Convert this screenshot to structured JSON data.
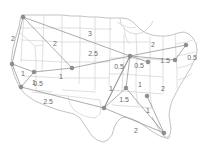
{
  "figure": {
    "title": "",
    "kind": "map-network-diagram",
    "basemap": "united-states-state-boundaries",
    "width": 202,
    "height": 151,
    "colors": {
      "background": "#ffffff",
      "state_border": "#c8c8c8",
      "country_outline": "#b0b0b0",
      "edge": "#8a8a8a",
      "node_fill": "#8f8f8f",
      "node_stroke": "#6e6e6e",
      "label_text": "#6a6a6a"
    }
  },
  "chart_data": {
    "type": "network",
    "title": "",
    "xlabel": "",
    "ylabel": "",
    "node_count": 13,
    "edge_count": 19,
    "weight_values": [
      0.5,
      1,
      1.5,
      2,
      2.5,
      3
    ],
    "nodes": [
      {
        "id": "n1",
        "label": "",
        "x": 23,
        "y": 17
      },
      {
        "id": "n2",
        "label": "",
        "x": 12,
        "y": 64
      },
      {
        "id": "n3",
        "label": "",
        "x": 34,
        "y": 72
      },
      {
        "id": "n4",
        "label": "",
        "x": 21,
        "y": 87
      },
      {
        "id": "n5",
        "label": "",
        "x": 72,
        "y": 68
      },
      {
        "id": "n6",
        "label": "",
        "x": 104,
        "y": 108
      },
      {
        "id": "n7",
        "label": "",
        "x": 130,
        "y": 56
      },
      {
        "id": "n8",
        "label": "",
        "x": 126,
        "y": 88
      },
      {
        "id": "n9",
        "label": "",
        "x": 147,
        "y": 96
      },
      {
        "id": "n10",
        "label": "",
        "x": 164,
        "y": 133
      },
      {
        "id": "n11",
        "label": "",
        "x": 186,
        "y": 45
      },
      {
        "id": "n12",
        "label": "",
        "x": 175,
        "y": 60
      },
      {
        "id": "n13",
        "label": "",
        "x": 148,
        "y": 62
      }
    ],
    "edges": [
      {
        "id": "e1",
        "from": "n1",
        "to": "n2",
        "weight": "2",
        "label_x": 13,
        "label_y": 38
      },
      {
        "id": "e2",
        "from": "n1",
        "to": "n5",
        "weight": "2",
        "label_x": 55,
        "label_y": 43
      },
      {
        "id": "e3",
        "from": "n1",
        "to": "n7",
        "weight": "3",
        "label_x": 90,
        "label_y": 33
      },
      {
        "id": "e4",
        "from": "n2",
        "to": "n3",
        "weight": "1",
        "label_x": 23,
        "label_y": 73
      },
      {
        "id": "e5",
        "from": "n2",
        "to": "n4",
        "weight": "1",
        "label_x": 34,
        "label_y": 82
      },
      {
        "id": "e6",
        "from": "n3",
        "to": "n4",
        "weight": "0.5",
        "label_x": 38,
        "label_y": 83
      },
      {
        "id": "e7",
        "from": "n3",
        "to": "n5",
        "weight": "1",
        "label_x": 61,
        "label_y": 76
      },
      {
        "id": "e8",
        "from": "n4",
        "to": "n6",
        "weight": "2.5",
        "label_x": 48,
        "label_y": 101
      },
      {
        "id": "e9",
        "from": "n5",
        "to": "n7",
        "weight": "2.5",
        "label_x": 93,
        "label_y": 53
      },
      {
        "id": "e10",
        "from": "n6",
        "to": "n7",
        "weight": "0.5",
        "label_x": 119,
        "label_y": 66
      },
      {
        "id": "e11",
        "from": "n6",
        "to": "n7",
        "weight": "1",
        "label_x": 111,
        "label_y": 88
      },
      {
        "id": "e12",
        "from": "n6",
        "to": "n8",
        "weight": "1.5",
        "label_x": 124,
        "label_y": 99
      },
      {
        "id": "e13",
        "from": "n6",
        "to": "n10",
        "weight": "2",
        "label_x": 136,
        "label_y": 130
      },
      {
        "id": "e14",
        "from": "n7",
        "to": "n8",
        "weight": "1",
        "label_x": 140,
        "label_y": 84
      },
      {
        "id": "e15",
        "from": "n7",
        "to": "n13",
        "weight": "0.5",
        "label_x": 139,
        "label_y": 65
      },
      {
        "id": "e16",
        "from": "n7",
        "to": "n11",
        "weight": "2",
        "label_x": 153,
        "label_y": 44
      },
      {
        "id": "e17",
        "from": "n7",
        "to": "n12",
        "weight": "1.5",
        "label_x": 165,
        "label_y": 60
      },
      {
        "id": "e18",
        "from": "n11",
        "to": "n12",
        "weight": "0.5",
        "label_x": 192,
        "label_y": 57
      },
      {
        "id": "e19",
        "from": "n9",
        "to": "n10",
        "weight": "1",
        "label_x": 148,
        "label_y": 110
      },
      {
        "id": "e20",
        "from": "n8",
        "to": "n10",
        "weight": "2",
        "label_x": 163,
        "label_y": 88
      }
    ]
  }
}
